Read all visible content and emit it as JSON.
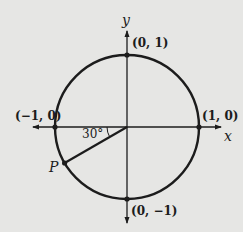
{
  "diagram": {
    "type": "unit-circle",
    "colors": {
      "background": "#e6e6e4",
      "stroke": "#1c1c1c"
    },
    "axes": {
      "x_label": "x",
      "y_label": "y"
    },
    "points": {
      "top": "(0, 1)",
      "bottom": "(0, −1)",
      "left": "(−1, 0)",
      "right": "(1, 0)",
      "p": "P"
    },
    "angle_label": "30°"
  }
}
